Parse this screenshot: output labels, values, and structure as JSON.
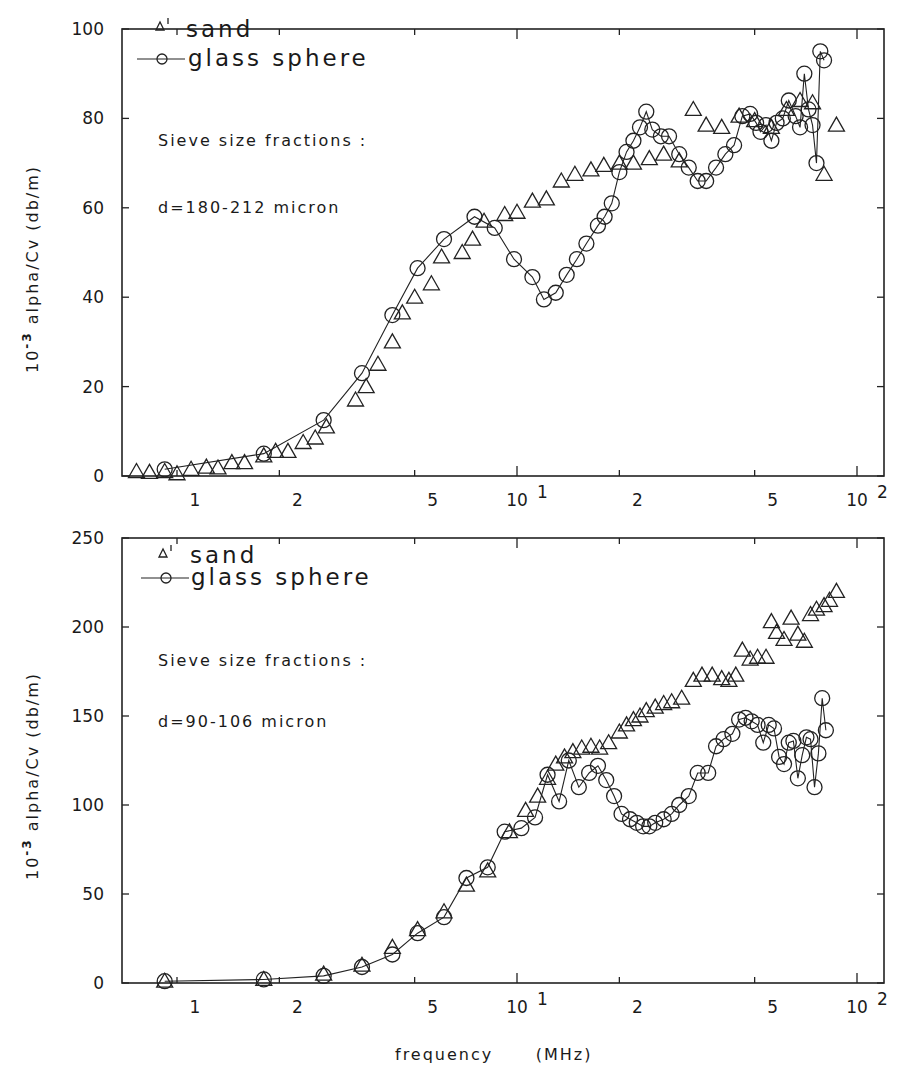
{
  "figure": {
    "x_axis_label": "frequency      (MHz)",
    "y_axis_label_prefix": "10",
    "y_axis_label_exp": "-3",
    "y_axis_label_main": " alpha/Cv  (db/m)"
  },
  "chart_data": [
    {
      "type": "scatter",
      "title": "",
      "xlabel": "frequency (MHz)",
      "ylabel": "10^-3 alpha/Cv (db/m)",
      "xscale": "log",
      "xlim": [
        0.69,
        120
      ],
      "ylim": [
        0,
        100
      ],
      "yticks": [
        0,
        20,
        40,
        60,
        80,
        100
      ],
      "xtick_labels": [
        {
          "value": 1,
          "label": "1"
        },
        {
          "value": 2,
          "label": "2"
        },
        {
          "value": 5,
          "label": "5"
        },
        {
          "value": 10,
          "label": "10",
          "sup": "1"
        },
        {
          "value": 20,
          "label": "2"
        },
        {
          "value": 50,
          "label": "5"
        },
        {
          "value": 100,
          "label": "10",
          "sup": "2"
        }
      ],
      "legend": [
        {
          "name": "sand",
          "marker": "triangle",
          "line": false
        },
        {
          "name": "glass sphere",
          "marker": "circle",
          "line": true
        }
      ],
      "annotations": [
        "Sieve size fractions :",
        "d=180-212 micron"
      ],
      "grid": false,
      "series": [
        {
          "name": "sand",
          "marker": "triangle",
          "line": false,
          "x": [
            0.76,
            0.83,
            0.92,
            1.0,
            1.1,
            1.22,
            1.32,
            1.45,
            1.58,
            1.8,
            1.95,
            2.12,
            2.35,
            2.55,
            2.75,
            3.35,
            3.6,
            3.9,
            4.3,
            4.6,
            5.0,
            5.6,
            6.0,
            6.9,
            7.4,
            8.0,
            9.2,
            10.0,
            11.1,
            12.2,
            13.5,
            14.8,
            16.5,
            18.0,
            20.0,
            22.0,
            24.5,
            27.0,
            30.0,
            33.0,
            36.0,
            40.0,
            45.0,
            50.0,
            56.0,
            62.0,
            68.0,
            74.0,
            80.0,
            87.0
          ],
          "y": [
            1.0,
            0.8,
            1.0,
            0.5,
            1.5,
            2.0,
            1.8,
            3.0,
            3.0,
            4.5,
            5.5,
            5.5,
            7.5,
            8.5,
            11.0,
            17.0,
            20.0,
            25.0,
            30.0,
            36.5,
            40.0,
            43.0,
            49.0,
            50.0,
            53.0,
            57.0,
            58.5,
            59.0,
            61.5,
            62.0,
            66.0,
            67.5,
            68.5,
            69.5,
            70.0,
            70.0,
            71.0,
            72.0,
            70.5,
            82.0,
            78.5,
            78.0,
            80.5,
            79.5,
            78.0,
            82.0,
            84.0,
            83.5,
            67.5,
            78.5
          ]
        },
        {
          "name": "glass sphere",
          "marker": "circle",
          "line": true,
          "x": [
            0.92,
            1.8,
            2.7,
            3.5,
            4.3,
            5.1,
            6.1,
            7.5,
            8.6,
            9.8,
            11.1,
            12.0,
            13.0,
            14.0,
            15.0,
            16.0,
            17.3,
            18.1,
            19.0,
            20.0,
            21.0,
            22.0,
            23.0,
            24.0,
            25.0,
            26.5,
            28.0,
            30.0,
            32.0,
            34.0,
            36.0,
            38.5,
            41.0,
            43.5,
            46.0,
            48.5,
            50.5,
            52.0,
            54.0,
            56.0,
            58.0,
            60.5,
            63.0,
            66.0,
            68.0,
            70.0,
            72.0,
            74.0,
            76.0,
            78.0,
            80.0
          ],
          "y": [
            1.5,
            5.0,
            12.5,
            23.0,
            36.0,
            46.5,
            53.0,
            58.0,
            55.5,
            48.5,
            44.5,
            39.5,
            41.0,
            45.0,
            48.5,
            52.0,
            56.0,
            58.0,
            61.0,
            68.0,
            72.5,
            75.0,
            78.0,
            81.5,
            77.5,
            76.0,
            76.0,
            72.0,
            69.0,
            66.0,
            66.0,
            69.0,
            72.0,
            74.0,
            80.5,
            81.0,
            79.0,
            77.0,
            78.5,
            75.0,
            79.0,
            80.0,
            84.0,
            80.5,
            78.0,
            90.0,
            82.0,
            78.5,
            70.0,
            95.0,
            93.0
          ]
        }
      ]
    },
    {
      "type": "scatter",
      "title": "",
      "xlabel": "frequency (MHz)",
      "ylabel": "10^-3 alpha/Cv (db/m)",
      "xscale": "log",
      "xlim": [
        0.69,
        120
      ],
      "ylim": [
        0,
        250
      ],
      "yticks": [
        0,
        50,
        100,
        150,
        200,
        250
      ],
      "xtick_labels": [
        {
          "value": 1,
          "label": "1"
        },
        {
          "value": 2,
          "label": "2"
        },
        {
          "value": 5,
          "label": "5"
        },
        {
          "value": 10,
          "label": "10",
          "sup": "1"
        },
        {
          "value": 20,
          "label": "2"
        },
        {
          "value": 50,
          "label": "5"
        },
        {
          "value": 100,
          "label": "10",
          "sup": "2"
        }
      ],
      "legend": [
        {
          "name": "sand",
          "marker": "triangle",
          "line": false
        },
        {
          "name": "glass sphere",
          "marker": "circle",
          "line": true
        }
      ],
      "annotations": [
        "Sieve size fractions :",
        "d=90-106 micron"
      ],
      "grid": false,
      "series": [
        {
          "name": "sand",
          "marker": "triangle",
          "line": false,
          "x": [
            0.92,
            1.8,
            2.7,
            3.5,
            4.3,
            5.1,
            6.1,
            7.1,
            8.2,
            9.5,
            10.6,
            11.5,
            12.3,
            13.0,
            13.8,
            14.6,
            15.5,
            16.5,
            17.5,
            18.6,
            20.0,
            21.0,
            22.0,
            23.0,
            24.0,
            25.5,
            27.0,
            28.5,
            30.5,
            33.0,
            35.0,
            37.5,
            40.0,
            42.0,
            44.0,
            46.0,
            48.5,
            51.0,
            54.0,
            56.0,
            58.0,
            61.0,
            64.0,
            67.0,
            70.0,
            73.0,
            76.0,
            80.0,
            83.0,
            87.0
          ],
          "y": [
            1.0,
            2.0,
            5.0,
            10.0,
            20.0,
            30.0,
            40.0,
            55.0,
            63.0,
            85.0,
            97.0,
            105.0,
            115.0,
            123.0,
            127.0,
            130.0,
            132.0,
            133.0,
            132.0,
            135.0,
            141.0,
            145.0,
            148.0,
            150.0,
            153.0,
            155.0,
            157.0,
            158.0,
            160.0,
            170.0,
            173.0,
            173.0,
            171.0,
            170.0,
            173.0,
            187.0,
            182.0,
            183.0,
            183.0,
            203.0,
            197.0,
            193.0,
            205.0,
            196.0,
            192.0,
            207.0,
            210.0,
            212.0,
            215.0,
            220.0
          ]
        },
        {
          "name": "glass sphere",
          "marker": "circle",
          "line": true,
          "x": [
            0.92,
            1.8,
            2.7,
            3.5,
            4.3,
            5.1,
            6.1,
            7.1,
            8.2,
            9.2,
            10.3,
            11.3,
            12.3,
            13.3,
            14.2,
            15.2,
            16.3,
            17.3,
            18.3,
            19.3,
            20.3,
            21.5,
            22.5,
            23.5,
            24.5,
            25.5,
            27.0,
            28.5,
            30.0,
            32.0,
            34.0,
            36.5,
            38.5,
            40.5,
            43.0,
            45.0,
            47.0,
            49.0,
            51.0,
            53.0,
            55.0,
            57.0,
            59.0,
            61.0,
            63.0,
            65.0,
            67.0,
            69.0,
            71.0,
            73.0,
            75.0,
            77.0,
            79.0,
            81.0
          ],
          "y": [
            1.0,
            2.0,
            4.0,
            9.0,
            16.0,
            28.0,
            37.0,
            59.0,
            65.0,
            85.0,
            87.0,
            93.0,
            117.0,
            102.0,
            125.0,
            110.0,
            118.0,
            122.0,
            114.0,
            105.0,
            95.0,
            92.0,
            90.0,
            88.0,
            88.0,
            90.0,
            92.0,
            95.0,
            100.0,
            105.0,
            118.0,
            118.0,
            133.0,
            137.0,
            140.0,
            148.0,
            149.0,
            147.0,
            145.0,
            135.0,
            145.0,
            143.0,
            127.0,
            123.0,
            135.0,
            136.0,
            115.0,
            128.0,
            138.0,
            137.0,
            110.0,
            129.0,
            160.0,
            142.0
          ]
        }
      ]
    }
  ],
  "panels": [
    {
      "legend": {
        "sand_label": "sand",
        "glass_label": "glass sphere"
      },
      "note_title": "Sieve size fractions :",
      "note_size": "d=180-212 micron",
      "y_ticks": [
        "0",
        "20",
        "40",
        "60",
        "80",
        "100"
      ]
    },
    {
      "legend": {
        "sand_label": "sand",
        "glass_label": "glass sphere"
      },
      "note_title": "Sieve size fractions :",
      "note_size": "d=90-106 micron",
      "y_ticks": [
        "0",
        "50",
        "100",
        "150",
        "200",
        "250"
      ]
    }
  ]
}
